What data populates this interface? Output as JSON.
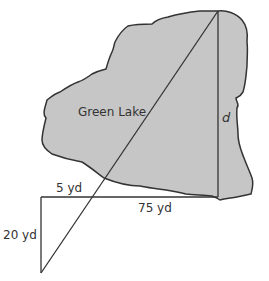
{
  "diagram": {
    "lake_label": "Green Lake",
    "unknown_label": "d",
    "segments": {
      "top_short": "5 yd",
      "bottom_long": "75 yd",
      "left_vertical": "20 yd"
    },
    "colors": {
      "lake_fill": "#c6c6c6",
      "stroke": "#333333",
      "background": "#ffffff"
    }
  }
}
